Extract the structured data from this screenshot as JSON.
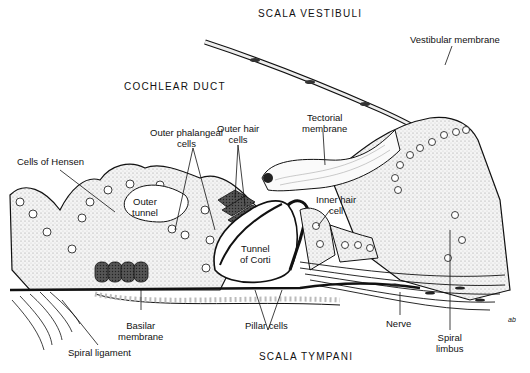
{
  "diagram": {
    "regions": {
      "scala_vestibuli": "SCALA VESTIBULI",
      "cochlear_duct": "COCHLEAR DUCT",
      "scala_tympani": "SCALA TYMPANI"
    },
    "labels": {
      "vestibular_membrane": "Vestibular membrane",
      "tectorial_membrane_1": "Tectorial",
      "tectorial_membrane_2": "membrane",
      "outer_phalangeal_cells_1": "Outer phalangeal",
      "outer_phalangeal_cells_2": "cells",
      "outer_hair_cells_1": "Outer hair",
      "outer_hair_cells_2": "cells",
      "cells_of_hensen": "Cells of Hensen",
      "inner_hair_cell_1": "Inner hair",
      "inner_hair_cell_2": "cell",
      "outer_tunnel_1": "Outer",
      "outer_tunnel_2": "tunnel",
      "tunnel_of_corti_1": "Tunnel",
      "tunnel_of_corti_2": "of Corti",
      "basilar_membrane_1": "Basilar",
      "basilar_membrane_2": "membrane",
      "pillar_cells": "Pillar cells",
      "nerve": "Nerve",
      "spiral_limbus_1": "Spiral",
      "spiral_limbus_2": "limbus",
      "spiral_ligament": "Spiral ligament",
      "signature": "ab"
    },
    "colors": {
      "ink": "#111111",
      "stipple": "#d8d8d8",
      "background": "#ffffff"
    }
  }
}
